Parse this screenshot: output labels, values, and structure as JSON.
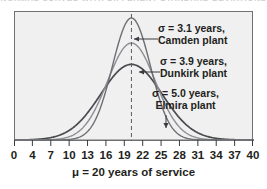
{
  "top_caption": "NORMAL CURVES WITH DIFFERENT STANDARD DEVIATIONS",
  "axis": {
    "title": "μ  =  20 years of service",
    "tick_labels": [
      "0",
      "4",
      "7",
      "10",
      "13",
      "16",
      "19",
      "22",
      "25",
      "28",
      "31",
      "34",
      "37",
      "40"
    ]
  },
  "annotations": [
    {
      "line1": "σ  =  3.1 years,",
      "line2": "Camden plant",
      "arrow": "arrow-left"
    },
    {
      "line1": "σ  =  3.9 years,",
      "line2": "Dunkirk plant",
      "arrow": "arrow-left"
    },
    {
      "line1": "σ  =  5.0 years,",
      "line2": "Elmira plant",
      "arrow": "arrow-down"
    }
  ],
  "colors": {
    "panel_fill": "#f0f0f1",
    "panel_border": "#6f7072",
    "curve_camden": "#6e6f73",
    "curve_dunkirk": "#8d8e92",
    "curve_elmira": "#4a4b4f",
    "mean_line": "#5a5b5f",
    "text": "#231f20"
  },
  "chart_data": {
    "type": "line",
    "title": "",
    "subtitle": "",
    "xlabel": "μ  =  20 years of service",
    "ylabel": "",
    "xlim": [
      0,
      40
    ],
    "ylim": [
      0,
      0.135
    ],
    "grid": false,
    "legend": "annotations-inline",
    "mean": 20,
    "mean_marker": "dashed vertical line at x = 20",
    "x_ticks": [
      0,
      4,
      7,
      10,
      13,
      16,
      19,
      22,
      25,
      28,
      31,
      34,
      37,
      40
    ],
    "series": [
      {
        "name": "Camden plant",
        "sigma": 3.1,
        "mu": 20,
        "peak_density": 0.1287,
        "distribution": "normal",
        "note": "tallest, narrowest curve"
      },
      {
        "name": "Dunkirk plant",
        "sigma": 3.9,
        "mu": 20,
        "peak_density": 0.1023,
        "distribution": "normal",
        "note": "middle curve"
      },
      {
        "name": "Elmira plant",
        "sigma": 5.0,
        "mu": 20,
        "peak_density": 0.0798,
        "distribution": "normal",
        "note": "shortest, widest curve"
      }
    ]
  }
}
